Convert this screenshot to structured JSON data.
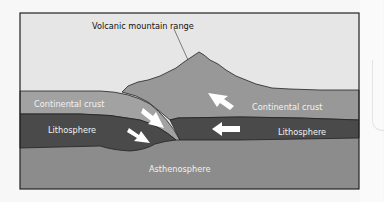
{
  "figure": {
    "title_label": "Volcanic mountain range",
    "layers": {
      "left_crust": "Continental crust",
      "right_crust": "Continental crust",
      "left_lithosphere": "Lithosphere",
      "right_lithosphere": "Lithosphere",
      "asthenosphere": "Asthenosphere"
    },
    "colors": {
      "sky": "#e6e6e6",
      "crust": "#9a9a9a",
      "mountain": "#969696",
      "lithosphere": "#4a4a4a",
      "asthenosphere": "#8a8a8a",
      "outline": "#222222",
      "arrow": "#ffffff"
    }
  }
}
